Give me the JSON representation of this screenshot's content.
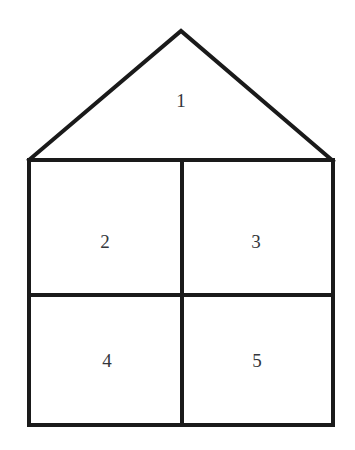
{
  "figure": {
    "background_color": "#ffffff",
    "stroke_color": "#1a1a1a",
    "stroke_width": 4,
    "label_color": "#33363b",
    "label_font_size": 19,
    "canvas": {
      "width": 355,
      "height": 450
    }
  },
  "geometry": {
    "roof": {
      "apex": {
        "x": 181,
        "y": 31
      },
      "left_eave": {
        "x": 29,
        "y": 160
      },
      "right_eave": {
        "x": 333,
        "y": 161
      }
    },
    "body": {
      "left": 29,
      "right": 333,
      "top": 160,
      "bottom": 425
    },
    "dividers": {
      "vertical_x": 182,
      "vertical_y_start": 160,
      "vertical_y_end": 425,
      "horizontal_y": 295,
      "horizontal_x_start": 29,
      "horizontal_x_end": 333
    }
  },
  "regions": [
    {
      "id": "region-1",
      "label": "1",
      "shape": "triangle",
      "position": {
        "x": 181,
        "y": 100
      }
    },
    {
      "id": "region-2",
      "label": "2",
      "shape": "rectangle",
      "position": {
        "x": 105,
        "y": 241
      }
    },
    {
      "id": "region-3",
      "label": "3",
      "shape": "rectangle",
      "position": {
        "x": 256,
        "y": 241
      }
    },
    {
      "id": "region-4",
      "label": "4",
      "shape": "rectangle",
      "position": {
        "x": 107,
        "y": 360
      }
    },
    {
      "id": "region-5",
      "label": "5",
      "shape": "rectangle",
      "position": {
        "x": 257,
        "y": 360
      }
    }
  ]
}
